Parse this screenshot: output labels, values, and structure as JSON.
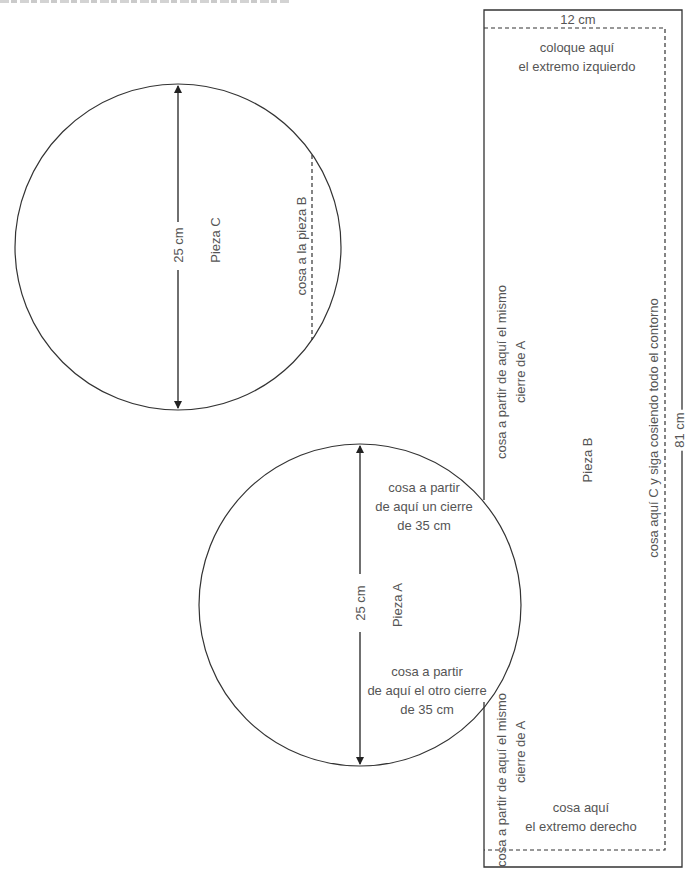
{
  "diagram": {
    "title_clipped": "",
    "colors": {
      "line": "#333333",
      "text": "#555555",
      "background": "#ffffff"
    },
    "pieces": {
      "piece_c": {
        "name": "Pieza C",
        "shape": "circle",
        "diameter_label": "25 cm",
        "seam_label": "cosa a la pieza B"
      },
      "piece_a": {
        "name": "Pieza A",
        "shape": "circle",
        "diameter_label": "25 cm",
        "upper_note": [
          "cosa a partir",
          "de aquí un cierre",
          "de 35 cm"
        ],
        "lower_note": [
          "cosa a partir",
          "de aquí el otro cierre",
          "de 35 cm"
        ]
      },
      "piece_b": {
        "name": "Pieza B",
        "shape": "rectangle",
        "width_label": "12 cm",
        "length_label": "81 cm",
        "top_note": [
          "coloque aquí",
          "el extremo izquierdo"
        ],
        "bottom_note": [
          "cosa aquí",
          "el extremo derecho"
        ],
        "right_note": "cosa aquí C y siga cosiendo todo el contorno",
        "upper_left_note": [
          "cosa a partir de aquí el mismo",
          "cierre de A"
        ],
        "lower_left_note": [
          "cosa a partir de aquí el mismo",
          "cierre de A"
        ]
      }
    }
  }
}
